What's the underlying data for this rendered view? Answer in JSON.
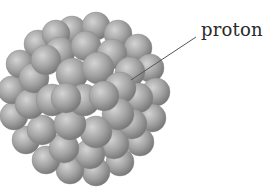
{
  "diagram": {
    "labels": [
      {
        "text": "proton",
        "points_to": "sphere in nucleus"
      }
    ],
    "colors": {
      "sphere_light": "#cfcfcf",
      "sphere_mid": "#9a9a9a",
      "sphere_dark": "#6e6e6e",
      "leader_line": "#555555",
      "label_text": "#2a2a2a"
    }
  }
}
